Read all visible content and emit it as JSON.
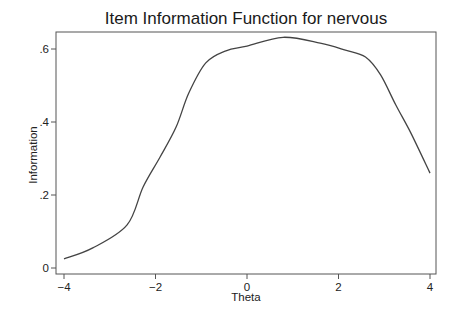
{
  "chart_data": {
    "type": "line",
    "title": "Item Information Function for nervous",
    "xlabel": "Theta",
    "ylabel": "Information",
    "xlim": [
      -4,
      4
    ],
    "ylim": [
      0,
      0.6
    ],
    "x_ticks": [
      -4,
      -2,
      0,
      2,
      4
    ],
    "x_tick_labels": [
      "−4",
      "−2",
      "0",
      "2",
      "4"
    ],
    "y_ticks": [
      0,
      0.2,
      0.4,
      0.6
    ],
    "y_tick_labels": [
      "0",
      ".2",
      ".4",
      ".6"
    ],
    "grid": false,
    "legend": null,
    "series": [
      {
        "name": "nervous",
        "color": "#444444",
        "x": [
          -4.0,
          -3.37,
          -2.62,
          -2.27,
          -1.9,
          -1.55,
          -1.27,
          -0.9,
          -0.46,
          0.0,
          0.79,
          1.6,
          2.15,
          2.59,
          2.92,
          3.25,
          3.58,
          4.0
        ],
        "values": [
          0.025,
          0.055,
          0.118,
          0.222,
          0.304,
          0.386,
          0.48,
          0.562,
          0.595,
          0.608,
          0.632,
          0.616,
          0.597,
          0.578,
          0.529,
          0.447,
          0.37,
          0.26
        ]
      }
    ]
  },
  "layout": {
    "frame_color": "#555555",
    "line_color": "#444444"
  }
}
